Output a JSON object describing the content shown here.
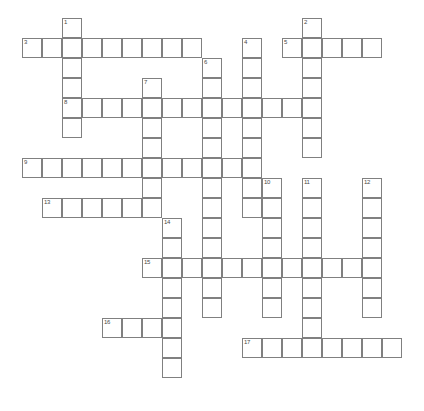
{
  "puzzle": {
    "type": "crossword-grid",
    "title": "",
    "grid": {
      "cell_size": 20,
      "origin_x": 22,
      "origin_y": 18,
      "cols": 20,
      "rows": 20,
      "border_color": "#808080",
      "cell_fill": "#ffffff",
      "number_color": "#4a4a4a"
    },
    "entries": [
      {
        "number": "1",
        "direction": "down",
        "col": 2,
        "row": 0,
        "length": 6
      },
      {
        "number": "2",
        "direction": "down",
        "col": 14,
        "row": 0,
        "length": 7
      },
      {
        "number": "3",
        "direction": "across",
        "col": 0,
        "row": 1,
        "length": 9
      },
      {
        "number": "4",
        "direction": "down",
        "col": 11,
        "row": 1,
        "length": 9
      },
      {
        "number": "5",
        "direction": "across",
        "col": 13,
        "row": 1,
        "length": 5
      },
      {
        "number": "6",
        "direction": "down",
        "col": 9,
        "row": 2,
        "length": 13
      },
      {
        "number": "7",
        "direction": "down",
        "col": 6,
        "row": 3,
        "length": 7
      },
      {
        "number": "8",
        "direction": "across",
        "col": 2,
        "row": 4,
        "length": 12
      },
      {
        "number": "9",
        "direction": "across",
        "col": 0,
        "row": 7,
        "length": 11
      },
      {
        "number": "10",
        "direction": "down",
        "col": 12,
        "row": 8,
        "length": 7
      },
      {
        "number": "11",
        "direction": "down",
        "col": 14,
        "row": 8,
        "length": 8
      },
      {
        "number": "12",
        "direction": "down",
        "col": 17,
        "row": 8,
        "length": 7
      },
      {
        "number": "13",
        "direction": "across",
        "col": 1,
        "row": 9,
        "length": 5
      },
      {
        "number": "14",
        "direction": "down",
        "col": 7,
        "row": 10,
        "length": 8
      },
      {
        "number": "15",
        "direction": "across",
        "col": 6,
        "row": 12,
        "length": 12
      },
      {
        "number": "16",
        "direction": "across",
        "col": 4,
        "row": 15,
        "length": 4
      },
      {
        "number": "17",
        "direction": "across",
        "col": 11,
        "row": 16,
        "length": 8
      }
    ]
  }
}
